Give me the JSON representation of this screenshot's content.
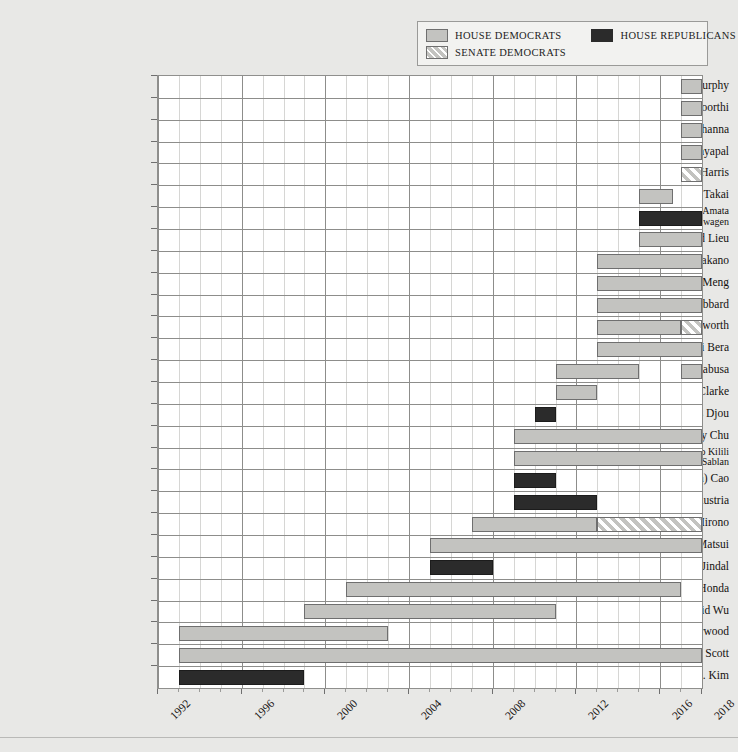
{
  "legend": {
    "items": [
      {
        "label": "HOUSE DEMOCRATS",
        "key": "hd",
        "color": "#c3c3c0"
      },
      {
        "label": "HOUSE REPUBLICANS",
        "key": "hr",
        "color": "#2b2b2b"
      },
      {
        "label": "SENATE DEMOCRATS",
        "key": "sd",
        "color": "#c3c3c0"
      }
    ]
  },
  "chart_data": {
    "type": "bar",
    "orientation": "horizontal-gantt",
    "title": "",
    "xlabel": "",
    "ylabel": "",
    "xlim": [
      1992,
      2018
    ],
    "grid": true,
    "legend_position": "top-right",
    "tick_labels": [
      "1992",
      "1996",
      "2000",
      "2004",
      "2008",
      "2012",
      "2016",
      "2018"
    ],
    "tick_values": [
      1992,
      1996,
      2000,
      2004,
      2008,
      2012,
      2016,
      2018
    ],
    "categories": [
      "Stephanie Murphy",
      "S. Raja Krishnamoorthi",
      "Ro Khanna",
      "Pramila Jayapal",
      "Kamala Harris",
      "Mark Takai",
      "Aumua Amata Coleman Radewagen",
      "Ted Lieu",
      "Mark Takano",
      "Grace Meng",
      "Tulsi Gabbard",
      "Tammy Duckworth",
      "Ami Bera",
      "Colleen Hanabusa",
      "Hansen Clarke",
      "Charles Djou",
      "Judy Chu",
      "Gregorio Kilili Camacho Sablan",
      "Anh (Joseph) Cao",
      "Steve Austria",
      "Mazie K. Hirono",
      "Doris Matsui",
      "Bobby Jindal",
      "Mike Honda",
      "David Wu",
      "Robert A. Underwood",
      "Robert C. (Bobby) Scott",
      "Jay C. Kim"
    ],
    "rows": [
      {
        "name": "Stephanie Murphy",
        "label_lines": [
          "Stephanie Murphy"
        ],
        "segments": [
          {
            "start": 2017,
            "end": 2018,
            "party": "hd"
          }
        ]
      },
      {
        "name": "S. Raja Krishnamoorthi",
        "label_lines": [
          "S. Raja Krishnamoorthi"
        ],
        "segments": [
          {
            "start": 2017,
            "end": 2018,
            "party": "hd"
          }
        ]
      },
      {
        "name": "Ro Khanna",
        "label_lines": [
          "Ro Khanna"
        ],
        "segments": [
          {
            "start": 2017,
            "end": 2018,
            "party": "hd"
          }
        ]
      },
      {
        "name": "Pramila Jayapal",
        "label_lines": [
          "Pramila Jayapal"
        ],
        "segments": [
          {
            "start": 2017,
            "end": 2018,
            "party": "hd"
          }
        ]
      },
      {
        "name": "Kamala Harris",
        "label_lines": [
          "Kamala Harris"
        ],
        "segments": [
          {
            "start": 2017,
            "end": 2018,
            "party": "sd"
          }
        ]
      },
      {
        "name": "Mark Takai",
        "label_lines": [
          "Mark Takai"
        ],
        "segments": [
          {
            "start": 2015,
            "end": 2016.6,
            "party": "hd"
          }
        ]
      },
      {
        "name": "Aumua Amata Coleman Radewagen",
        "label_lines": [
          "Aumua Amata",
          "Coleman Radewagen"
        ],
        "segments": [
          {
            "start": 2015,
            "end": 2018,
            "party": "hr"
          }
        ]
      },
      {
        "name": "Ted Lieu",
        "label_lines": [
          "Ted Lieu"
        ],
        "segments": [
          {
            "start": 2015,
            "end": 2018,
            "party": "hd"
          }
        ]
      },
      {
        "name": "Mark Takano",
        "label_lines": [
          "Mark Takano"
        ],
        "segments": [
          {
            "start": 2013,
            "end": 2018,
            "party": "hd"
          }
        ]
      },
      {
        "name": "Grace Meng",
        "label_lines": [
          "Grace Meng"
        ],
        "segments": [
          {
            "start": 2013,
            "end": 2018,
            "party": "hd"
          }
        ]
      },
      {
        "name": "Tulsi Gabbard",
        "label_lines": [
          "Tulsi Gabbard"
        ],
        "segments": [
          {
            "start": 2013,
            "end": 2018,
            "party": "hd"
          }
        ]
      },
      {
        "name": "Tammy Duckworth",
        "label_lines": [
          "Tammy Duckworth"
        ],
        "segments": [
          {
            "start": 2013,
            "end": 2017,
            "party": "hd"
          },
          {
            "start": 2017,
            "end": 2018,
            "party": "sd"
          }
        ]
      },
      {
        "name": "Ami Bera",
        "label_lines": [
          "Ami Bera"
        ],
        "segments": [
          {
            "start": 2013,
            "end": 2018,
            "party": "hd"
          }
        ]
      },
      {
        "name": "Colleen Hanabusa",
        "label_lines": [
          "Colleen Hanabusa"
        ],
        "segments": [
          {
            "start": 2011,
            "end": 2015,
            "party": "hd"
          },
          {
            "start": 2017,
            "end": 2018,
            "party": "hd"
          }
        ]
      },
      {
        "name": "Hansen Clarke",
        "label_lines": [
          "Hansen Clarke"
        ],
        "segments": [
          {
            "start": 2011,
            "end": 2013,
            "party": "hd"
          }
        ]
      },
      {
        "name": "Charles Djou",
        "label_lines": [
          "Charles Djou"
        ],
        "segments": [
          {
            "start": 2010,
            "end": 2011,
            "party": "hr"
          }
        ]
      },
      {
        "name": "Judy Chu",
        "label_lines": [
          "Judy Chu"
        ],
        "segments": [
          {
            "start": 2009,
            "end": 2018,
            "party": "hd"
          }
        ]
      },
      {
        "name": "Gregorio Kilili Camacho Sablan",
        "label_lines": [
          "Gregorio Kilili",
          "Camacho Sablan"
        ],
        "segments": [
          {
            "start": 2009,
            "end": 2018,
            "party": "hd"
          }
        ]
      },
      {
        "name": "Anh (Joseph) Cao",
        "label_lines": [
          "Anh (Joseph) Cao"
        ],
        "segments": [
          {
            "start": 2009,
            "end": 2011,
            "party": "hr"
          }
        ]
      },
      {
        "name": "Steve Austria",
        "label_lines": [
          "Steve Austria"
        ],
        "segments": [
          {
            "start": 2009,
            "end": 2013,
            "party": "hr"
          }
        ]
      },
      {
        "name": "Mazie K. Hirono",
        "label_lines": [
          "Mazie K. Hirono"
        ],
        "segments": [
          {
            "start": 2007,
            "end": 2013,
            "party": "hd"
          },
          {
            "start": 2013,
            "end": 2018,
            "party": "sd"
          }
        ]
      },
      {
        "name": "Doris Matsui",
        "label_lines": [
          "Doris Matsui"
        ],
        "segments": [
          {
            "start": 2005,
            "end": 2018,
            "party": "hd"
          }
        ]
      },
      {
        "name": "Bobby Jindal",
        "label_lines": [
          "Bobby Jindal"
        ],
        "segments": [
          {
            "start": 2005,
            "end": 2008,
            "party": "hr"
          }
        ]
      },
      {
        "name": "Mike Honda",
        "label_lines": [
          "Mike Honda"
        ],
        "segments": [
          {
            "start": 2001,
            "end": 2017,
            "party": "hd"
          }
        ]
      },
      {
        "name": "David Wu",
        "label_lines": [
          "David Wu"
        ],
        "segments": [
          {
            "start": 1999,
            "end": 2011,
            "party": "hd"
          }
        ]
      },
      {
        "name": "Robert A. Underwood",
        "label_lines": [
          "Robert A. Underwood"
        ],
        "segments": [
          {
            "start": 1993,
            "end": 2003,
            "party": "hd"
          }
        ]
      },
      {
        "name": "Robert C. (Bobby) Scott",
        "label_lines": [
          "Robert C. (Bobby) Scott"
        ],
        "segments": [
          {
            "start": 1993,
            "end": 2018,
            "party": "hd"
          }
        ]
      },
      {
        "name": "Jay C. Kim",
        "label_lines": [
          "Jay C. Kim"
        ],
        "segments": [
          {
            "start": 1993,
            "end": 1999,
            "party": "hr"
          }
        ]
      }
    ]
  }
}
